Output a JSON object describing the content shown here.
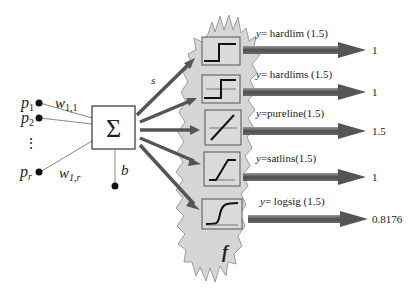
{
  "diagram": {
    "inputs": [
      {
        "label": "p",
        "sub": "1"
      },
      {
        "label": "p",
        "sub": "2"
      },
      {
        "label": "⋮",
        "sub": ""
      },
      {
        "label": "p",
        "sub": "r"
      }
    ],
    "weights": [
      {
        "label": "w",
        "sub": "1,1"
      },
      {
        "label": "w",
        "sub": "1,r"
      }
    ],
    "summer_symbol": "Σ",
    "bias_label": "b",
    "net_input_label": "s",
    "transfer_group_label": "f",
    "colors": {
      "cloud_fill": "#d6d6d6",
      "cloud_stroke": "#9a9a9a",
      "arrow": "#555555",
      "arrow_shadow": "#bdbdbd",
      "box_stroke": "#333333"
    },
    "functions": [
      {
        "name": "hardlim",
        "equation_prefix": "y",
        "equation": "= hardlim (1.5)",
        "output": "1"
      },
      {
        "name": "hardlims",
        "equation_prefix": "y",
        "equation": "= hardlims (1.5)",
        "output": "1"
      },
      {
        "name": "purelin",
        "equation_prefix": "y",
        "equation": "=pureline(1.5)",
        "output": "1.5"
      },
      {
        "name": "satlins",
        "equation_prefix": "y",
        "equation": "=satlins(1.5)",
        "output": "1"
      },
      {
        "name": "logsig",
        "equation_prefix": "y",
        "equation": "= logsig (1.5)",
        "output": "0.8176"
      }
    ]
  }
}
